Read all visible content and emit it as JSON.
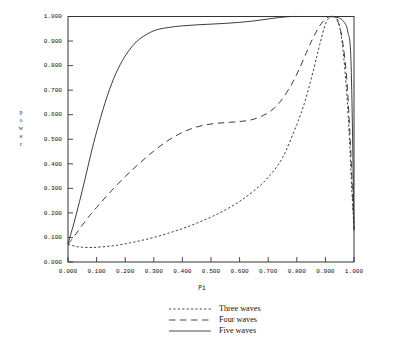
{
  "chart_data": {
    "type": "line",
    "title": "",
    "xlabel": "Pi",
    "ylabel": "power",
    "ylabel_chars": [
      "p",
      "o",
      "w",
      "e",
      "r"
    ],
    "xlim": [
      0.0,
      1.0
    ],
    "ylim": [
      0.0,
      1.0
    ],
    "grid": false,
    "legend_position": "bottom-center",
    "xticklabels": [
      "0.000",
      "0.100",
      "0.200",
      "0.300",
      "0.400",
      "0.500",
      "0.600",
      "0.700",
      "0.800",
      "0.900",
      "1.000"
    ],
    "xticks": [
      0.0,
      0.1,
      0.2,
      0.3,
      0.4,
      0.5,
      0.6,
      0.7,
      0.8,
      0.9,
      1.0
    ],
    "yticklabels": [
      "0.000",
      "0.100",
      "0.200",
      "0.300",
      "0.400",
      "0.500",
      "0.600",
      "0.700",
      "0.800",
      "0.900",
      "1.000"
    ],
    "yticks": [
      0.0,
      0.1,
      0.2,
      0.3,
      0.4,
      0.5,
      0.6,
      0.7,
      0.8,
      0.9,
      1.0
    ],
    "series": [
      {
        "name": "Three waves",
        "style": "dotted",
        "color": "#333333",
        "x": [
          0.0,
          0.025,
          0.05,
          0.075,
          0.1,
          0.15,
          0.2,
          0.25,
          0.3,
          0.35,
          0.4,
          0.45,
          0.5,
          0.55,
          0.6,
          0.65,
          0.7,
          0.75,
          0.8,
          0.83,
          0.86,
          0.88,
          0.9,
          0.915,
          0.93,
          0.945,
          0.96,
          0.975,
          0.985,
          0.992,
          1.0
        ],
        "values": [
          0.072,
          0.064,
          0.06,
          0.059,
          0.06,
          0.065,
          0.074,
          0.086,
          0.1,
          0.117,
          0.136,
          0.158,
          0.183,
          0.212,
          0.247,
          0.29,
          0.345,
          0.425,
          0.56,
          0.66,
          0.79,
          0.885,
          0.968,
          0.996,
          1.0,
          0.98,
          0.88,
          0.68,
          0.48,
          0.3,
          0.14
        ]
      },
      {
        "name": "Four waves",
        "style": "dashed",
        "color": "#333333",
        "x": [
          0.0,
          0.025,
          0.05,
          0.075,
          0.1,
          0.15,
          0.2,
          0.25,
          0.3,
          0.35,
          0.4,
          0.45,
          0.5,
          0.55,
          0.6,
          0.65,
          0.7,
          0.74,
          0.78,
          0.81,
          0.84,
          0.86,
          0.88,
          0.9,
          0.915,
          0.93,
          0.945,
          0.96,
          0.975,
          0.988,
          1.0
        ],
        "values": [
          0.072,
          0.11,
          0.15,
          0.188,
          0.222,
          0.288,
          0.348,
          0.402,
          0.452,
          0.495,
          0.528,
          0.55,
          0.562,
          0.568,
          0.572,
          0.582,
          0.608,
          0.65,
          0.72,
          0.79,
          0.87,
          0.92,
          0.962,
          0.99,
          0.999,
          0.998,
          0.975,
          0.9,
          0.74,
          0.47,
          0.13
        ]
      },
      {
        "name": "Five waves",
        "style": "solid",
        "color": "#333333",
        "x": [
          0.0,
          0.02,
          0.04,
          0.06,
          0.08,
          0.1,
          0.13,
          0.16,
          0.19,
          0.22,
          0.25,
          0.3,
          0.35,
          0.4,
          0.45,
          0.5,
          0.55,
          0.6,
          0.65,
          0.7,
          0.74,
          0.78,
          0.81,
          0.84,
          0.87,
          0.9,
          0.925,
          0.945,
          0.962,
          0.978,
          0.99,
          1.0
        ],
        "values": [
          0.075,
          0.155,
          0.245,
          0.34,
          0.44,
          0.53,
          0.65,
          0.748,
          0.82,
          0.872,
          0.908,
          0.942,
          0.955,
          0.962,
          0.966,
          0.969,
          0.972,
          0.976,
          0.982,
          0.99,
          0.996,
          1.0,
          1.0,
          1.0,
          1.0,
          1.0,
          0.999,
          0.995,
          0.982,
          0.94,
          0.8,
          0.13
        ]
      }
    ]
  },
  "legend": {
    "items": [
      {
        "label": "Three waves",
        "style": "dotted"
      },
      {
        "label": "Four waves",
        "style": "dashed"
      },
      {
        "label": "Five waves",
        "style": "solid"
      }
    ]
  }
}
